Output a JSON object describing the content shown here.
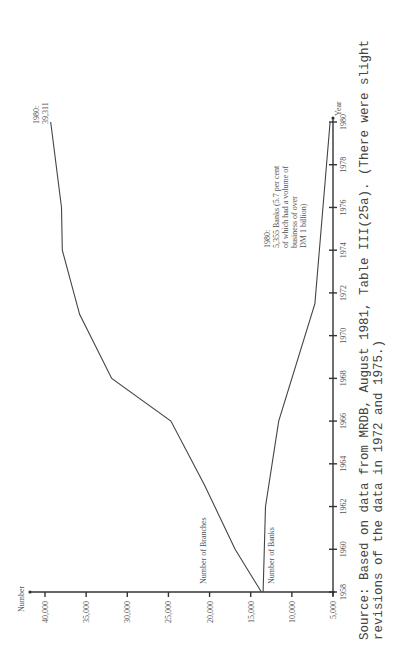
{
  "chart_data": {
    "type": "line",
    "title": "",
    "xlabel": "Year",
    "ylabel": "Number",
    "orientation_note": "rotated 90 degrees counter-clockwise on page",
    "x_ticks": [
      "1958",
      "1960",
      "1962",
      "1964",
      "1966",
      "1968",
      "1970",
      "1972",
      "1974",
      "1976",
      "1978",
      "1980"
    ],
    "y_ticks": [
      "5,000",
      "10,000",
      "15,000",
      "20,000",
      "25,000",
      "30,000",
      "35,000",
      "40,000"
    ],
    "ylim": [
      5000,
      40000
    ],
    "xlim": [
      1958,
      1980
    ],
    "series": [
      {
        "name": "Number of Branches",
        "x": [
          1958,
          1960,
          1963,
          1966,
          1968,
          1971,
          1974,
          1976,
          1980
        ],
        "values": [
          13700,
          16900,
          20600,
          24700,
          31900,
          35800,
          37900,
          38000,
          39311
        ]
      },
      {
        "name": "Number of Banks",
        "x": [
          1958,
          1962,
          1966,
          1971.5,
          1980
        ],
        "values": [
          13500,
          13200,
          11600,
          7200,
          5355
        ]
      }
    ],
    "annotations": [
      {
        "lines": [
          "1980:",
          "39,311"
        ]
      },
      {
        "lines": [
          "1980:",
          "5,355 Banks (5.7 per cent",
          "of which had a volume of",
          "business of over",
          "DM 1 billion)"
        ]
      }
    ],
    "source": {
      "line1": "Source:  Based on data from MRDB, August 1981, Table III(25a).  (There were slight",
      "line2": "revisions of the data in 1972 and 1975.)"
    }
  },
  "labels": {
    "ylabel": "Number",
    "xlabel": "Year",
    "branches": "Number of Branches",
    "banks": "Number of Banks",
    "ann_branch_1": "1980:",
    "ann_branch_2": "39,311",
    "ann_bank_1": "1980:",
    "ann_bank_2": "5,355 Banks (5.7 per cent",
    "ann_bank_3": "of which had a volume of",
    "ann_bank_4": "business of over",
    "ann_bank_5": "DM 1 billion)",
    "source_1": "Source:  Based on data from MRDB, August 1981, Table III(25a).  (There were slight",
    "source_2": "revisions of the data in 1972 and 1975.)",
    "page_mark": "82"
  }
}
